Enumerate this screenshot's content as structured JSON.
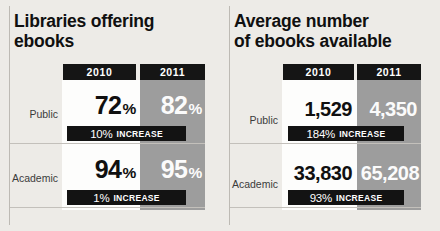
{
  "chart_data": {
    "type": "table",
    "panels": [
      {
        "title": "Libraries offering\nebooks",
        "columns": [
          "2010",
          "2011"
        ],
        "categories": [
          "Public",
          "Academic"
        ],
        "unit": "percent",
        "rows": [
          {
            "label": "Public",
            "values": [
              "72",
              "94"
            ]
          },
          {
            "label": "Academic",
            "values": [
              "94",
              "95"
            ]
          }
        ],
        "series": [
          {
            "name": "2010",
            "values": [
              72,
              94
            ]
          },
          {
            "name": "2011",
            "values": [
              82,
              95
            ]
          }
        ],
        "increases": [
          "10% INCREASE",
          "1% INCREASE"
        ]
      },
      {
        "title": "Average number\nof ebooks available",
        "columns": [
          "2010",
          "2011"
        ],
        "categories": [
          "Public",
          "Academic"
        ],
        "unit": "count",
        "series": [
          {
            "name": "2010",
            "values": [
              1529,
              33830
            ]
          },
          {
            "name": "2011",
            "values": [
              4350,
              65208
            ]
          }
        ],
        "increases": [
          "184% INCREASE",
          "93% INCREASE"
        ]
      }
    ],
    "colors": {
      "background": "#edebe7",
      "card": "#fdfdfc",
      "column_2011": "#9d9d9d",
      "header_chip": "#151515",
      "badge": "#131313",
      "text_dark": "#101010",
      "text_light": "#fbfbfb"
    }
  },
  "left_panel": {
    "title_line1": "Libraries offering",
    "title_line2": "ebooks",
    "header_2010": "2010",
    "header_2011": "2011",
    "rows": {
      "public": {
        "label": "Public",
        "value_2010": "72",
        "value_2010_unit": "%",
        "value_2011": "82",
        "value_2011_unit": "%",
        "increase_value": "10%",
        "increase_word": "INCREASE"
      },
      "academic": {
        "label": "Academic",
        "value_2010": "94",
        "value_2010_unit": "%",
        "value_2011": "95",
        "value_2011_unit": "%",
        "increase_value": "1%",
        "increase_word": "INCREASE"
      }
    }
  },
  "right_panel": {
    "title_line1": "Average number",
    "title_line2": "of ebooks available",
    "header_2010": "2010",
    "header_2011": "2011",
    "rows": {
      "public": {
        "label": "Public",
        "value_2010": "1,529",
        "value_2011": "4,350",
        "increase_value": "184%",
        "increase_word": "INCREASE"
      },
      "academic": {
        "label": "Academic",
        "value_2010": "33,830",
        "value_2011": "65,208",
        "increase_value": "93%",
        "increase_word": "INCREASE"
      }
    }
  }
}
